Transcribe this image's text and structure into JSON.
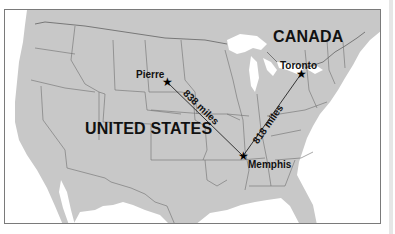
{
  "map": {
    "countries": {
      "canada": "CANADA",
      "united_states": "UNITED STATES"
    },
    "cities": [
      {
        "name": "Pierre",
        "marker": "star-icon"
      },
      {
        "name": "Toronto",
        "marker": "star-icon"
      },
      {
        "name": "Memphis",
        "marker": "star-icon"
      }
    ],
    "routes": [
      {
        "from": "Pierre",
        "to": "Memphis",
        "label": "838 miles"
      },
      {
        "from": "Memphis",
        "to": "Toronto",
        "label": "818 miles"
      }
    ],
    "colors": {
      "land": "#c8c8c8",
      "water": "#ffffff",
      "borders": "#6e6e6e",
      "text": "#111111"
    },
    "star_glyph": "★"
  }
}
